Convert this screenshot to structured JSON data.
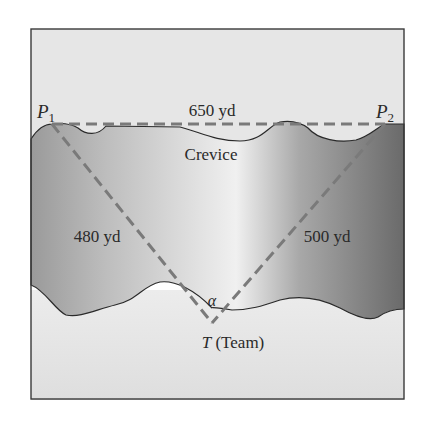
{
  "diagram": {
    "points": {
      "p1": {
        "letter": "P",
        "sub": "1"
      },
      "p2": {
        "letter": "P",
        "sub": "2"
      },
      "t": {
        "letter": "T",
        "desc": " (Team)"
      }
    },
    "distances": {
      "p1_p2": "650 yd",
      "p1_t": "480 yd",
      "p2_t": "500 yd"
    },
    "region_label": "Crevice",
    "angle_label": "α",
    "colors": {
      "frame": "#3a3a3a",
      "dashed_line": "#7a7a7a",
      "sky": "#e6e6e6",
      "ground": "#e4e4e4",
      "crevice_dark": "#6e6e6e",
      "crevice_light": "#f2f2f2"
    }
  }
}
